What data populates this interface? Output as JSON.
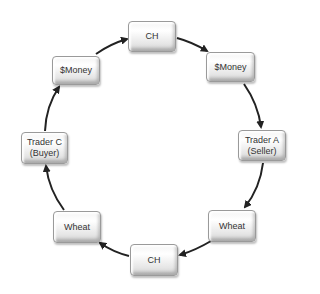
{
  "diagram": {
    "type": "cycle",
    "direction": "clockwise",
    "nodes": [
      {
        "id": "ch_top",
        "label": "CH"
      },
      {
        "id": "money_right",
        "label": "$Money"
      },
      {
        "id": "trader_a",
        "label": "Trader A\n(Seller)"
      },
      {
        "id": "wheat_right",
        "label": "Wheat"
      },
      {
        "id": "ch_bottom",
        "label": "CH"
      },
      {
        "id": "wheat_left",
        "label": "Wheat"
      },
      {
        "id": "trader_c",
        "label": "Trader C\n(Buyer)"
      },
      {
        "id": "money_left",
        "label": "$Money"
      }
    ],
    "edges": [
      {
        "from": "ch_top",
        "to": "money_right"
      },
      {
        "from": "money_right",
        "to": "trader_a"
      },
      {
        "from": "trader_a",
        "to": "wheat_right"
      },
      {
        "from": "wheat_right",
        "to": "ch_bottom"
      },
      {
        "from": "ch_bottom",
        "to": "wheat_left"
      },
      {
        "from": "wheat_left",
        "to": "trader_c"
      },
      {
        "from": "trader_c",
        "to": "money_left"
      },
      {
        "from": "money_left",
        "to": "ch_top"
      }
    ]
  }
}
